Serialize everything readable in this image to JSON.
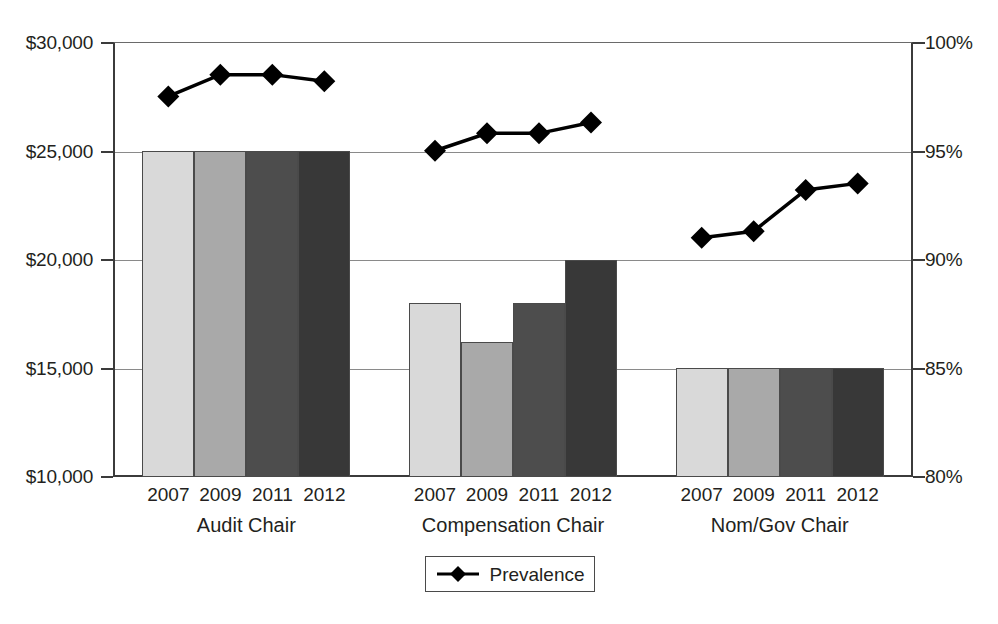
{
  "chart_data": {
    "type": "bar",
    "title": "",
    "subtitle": "",
    "xlabel": "",
    "ylabel": "",
    "grid": true,
    "legend_position": "bottom-center",
    "categories": [
      "2007",
      "2009",
      "2011",
      "2012"
    ],
    "groups": [
      "Audit Chair",
      "Compensation Chair",
      "Nom/Gov Chair"
    ],
    "left_axis": {
      "label": "",
      "ylim": [
        10000,
        30000
      ],
      "tick_values": [
        10000,
        15000,
        20000,
        25000,
        30000
      ],
      "tick_labels": [
        "$10,000",
        "$15,000",
        "$20,000",
        "$25,000",
        "$30,000"
      ]
    },
    "right_axis": {
      "label": "",
      "ylim": [
        80,
        100
      ],
      "tick_values": [
        80,
        85,
        90,
        95,
        100
      ],
      "tick_labels": [
        "80%",
        "85%",
        "90%",
        "95%",
        "100%"
      ]
    },
    "bar_series": [
      {
        "group": "Audit Chair",
        "values": [
          25000,
          25000,
          25000,
          25000
        ],
        "shades": [
          "#d9d9d9",
          "#a9a9a9",
          "#4d4d4d",
          "#383838"
        ]
      },
      {
        "group": "Compensation Chair",
        "values": [
          18000,
          16200,
          18000,
          20000
        ],
        "shades": [
          "#d9d9d9",
          "#a9a9a9",
          "#4d4d4d",
          "#383838"
        ]
      },
      {
        "group": "Nom/Gov Chair",
        "values": [
          15000,
          15000,
          15000,
          15000
        ],
        "shades": [
          "#d9d9d9",
          "#a9a9a9",
          "#4d4d4d",
          "#383838"
        ]
      }
    ],
    "line_series": [
      {
        "name": "Prevalence",
        "axis": "right",
        "marker": "diamond",
        "color": "#000000",
        "group_values": [
          {
            "group": "Audit Chair",
            "values": [
              97.5,
              98.5,
              98.5,
              98.2
            ]
          },
          {
            "group": "Compensation Chair",
            "values": [
              95.0,
              95.8,
              95.8,
              96.3
            ]
          },
          {
            "group": "Nom/Gov Chair",
            "values": [
              91.0,
              91.3,
              93.2,
              93.5
            ]
          }
        ]
      }
    ]
  },
  "axis_left": {
    "ticks": [
      {
        "label": "$30,000"
      },
      {
        "label": "$25,000"
      },
      {
        "label": "$20,000"
      },
      {
        "label": "$15,000"
      },
      {
        "label": "$10,000"
      }
    ]
  },
  "axis_right": {
    "ticks": [
      {
        "label": "100%"
      },
      {
        "label": "95%"
      },
      {
        "label": "90%"
      },
      {
        "label": "85%"
      },
      {
        "label": "80%"
      }
    ]
  },
  "x_axis": {
    "groups": [
      {
        "name": "Audit Chair",
        "years": [
          "2007",
          "2009",
          "2011",
          "2012"
        ]
      },
      {
        "name": "Compensation Chair",
        "years": [
          "2007",
          "2009",
          "2011",
          "2012"
        ]
      },
      {
        "name": "Nom/Gov Chair",
        "years": [
          "2007",
          "2009",
          "2011",
          "2012"
        ]
      }
    ]
  },
  "legend": {
    "entries": [
      {
        "label": "Prevalence",
        "marker": "diamond",
        "color": "#000000"
      }
    ]
  }
}
